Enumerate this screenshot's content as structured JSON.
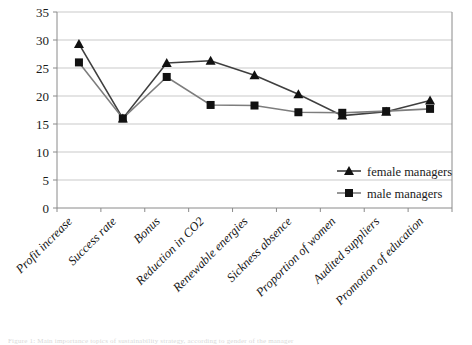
{
  "chart_data": {
    "type": "line",
    "title": "",
    "xlabel": "",
    "ylabel": "",
    "ylim": [
      0,
      35
    ],
    "ytick_step": 5,
    "yticks": [
      35,
      30,
      25,
      20,
      15,
      10,
      5,
      0
    ],
    "grid": true,
    "legend_position": "right-inside",
    "categories": [
      "Profit increase",
      "Success rate",
      "Bonus",
      "Reduction in CO2",
      "Renewable energies",
      "Sickness absence",
      "Proportion of women",
      "Audited suppliers",
      "Promotion of education"
    ],
    "series": [
      {
        "name": "female managers",
        "marker": "triangle",
        "color": "#3f3f3f",
        "values": [
          29.3,
          16.0,
          25.9,
          26.3,
          23.7,
          20.3,
          16.5,
          17.2,
          19.2
        ]
      },
      {
        "name": "male managers",
        "marker": "square",
        "color": "#7d7d7d",
        "values": [
          26.0,
          16.0,
          23.4,
          18.4,
          18.3,
          17.1,
          17.0,
          17.3,
          17.7
        ]
      }
    ]
  },
  "legend": {
    "entries": [
      {
        "label": "female managers",
        "marker": "triangle"
      },
      {
        "label": "male managers",
        "marker": "square"
      }
    ]
  },
  "caption": {
    "text": "Figure 1: Main importance topics of sustainability strategy, according to gender of the manager"
  },
  "colors": {
    "female_series": "#3f3f3f",
    "male_series": "#7d7d7d",
    "gridline": "#c9c9c9",
    "axis": "#8a8a8a",
    "text": "#1a1a1a",
    "background": "#ffffff"
  }
}
